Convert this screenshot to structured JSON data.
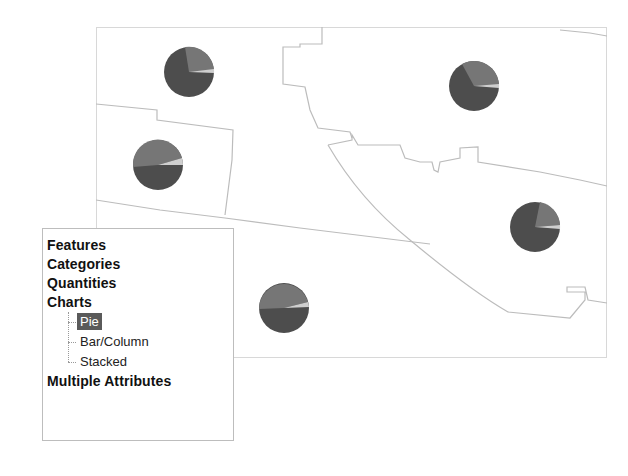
{
  "legend_panel": {
    "items": [
      {
        "label": "Features"
      },
      {
        "label": "Categories"
      },
      {
        "label": "Quantities"
      },
      {
        "label": "Charts"
      }
    ],
    "chart_children": [
      {
        "label": "Pie",
        "selected": true
      },
      {
        "label": "Bar/Column",
        "selected": false
      },
      {
        "label": "Stacked",
        "selected": false
      }
    ],
    "last_item": {
      "label": "Multiple Attributes"
    }
  },
  "map": {
    "pie_colors": {
      "major": "#4d4d4d",
      "secondary": "#767676",
      "minor": "#cfcfcf"
    },
    "boundary_color": "#bcbcbc",
    "pie_symbols": [
      {
        "id": "pie-1",
        "cx": 189,
        "cy": 72,
        "r": 25
      },
      {
        "id": "pie-2",
        "cx": 158,
        "cy": 165,
        "r": 25
      },
      {
        "id": "pie-3",
        "cx": 474,
        "cy": 86,
        "r": 25
      },
      {
        "id": "pie-4",
        "cx": 535,
        "cy": 227,
        "r": 25
      },
      {
        "id": "pie-5",
        "cx": 284,
        "cy": 308,
        "r": 25
      }
    ]
  }
}
